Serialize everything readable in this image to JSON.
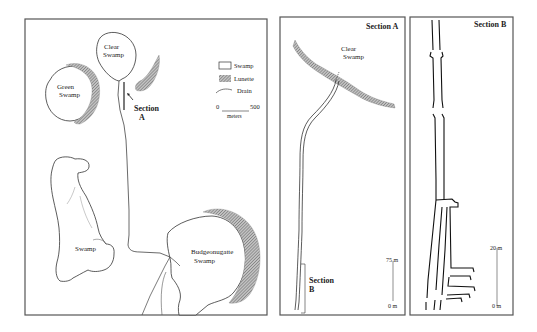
{
  "figure": {
    "panels": [
      {
        "id": "overview-map",
        "labels": {
          "clear_swamp_line1": "Clear",
          "clear_swamp_line2": "Swamp",
          "green_swamp_line1": "Green",
          "green_swamp_line2": "Swamp",
          "swamp": "Swamp",
          "budgeonugatte_line1": "Budgeonugatte",
          "budgeonugatte_line2": "Swamp",
          "section_a_line1": "Section",
          "section_a_line2": "A"
        },
        "legend": {
          "swamp": "Swamp",
          "lunette": "Lunette",
          "drain": "Drain",
          "scale_start": "0",
          "scale_end": "500",
          "scale_unit": "meters"
        }
      },
      {
        "id": "section-a",
        "title": "Section A",
        "labels": {
          "clear_swamp_line1": "Clear",
          "clear_swamp_line2": "Swamp",
          "section_b_line1": "Section",
          "section_b_line2": "B"
        },
        "scale": {
          "top": "75 m",
          "bottom": "0 m"
        }
      },
      {
        "id": "section-b",
        "title": "Section B",
        "scale": {
          "top": "20 m",
          "bottom": "0 m"
        }
      }
    ],
    "colors": {
      "line": "#333333",
      "lunette_hatch": "#7a7a7a",
      "border": "#555555"
    }
  }
}
